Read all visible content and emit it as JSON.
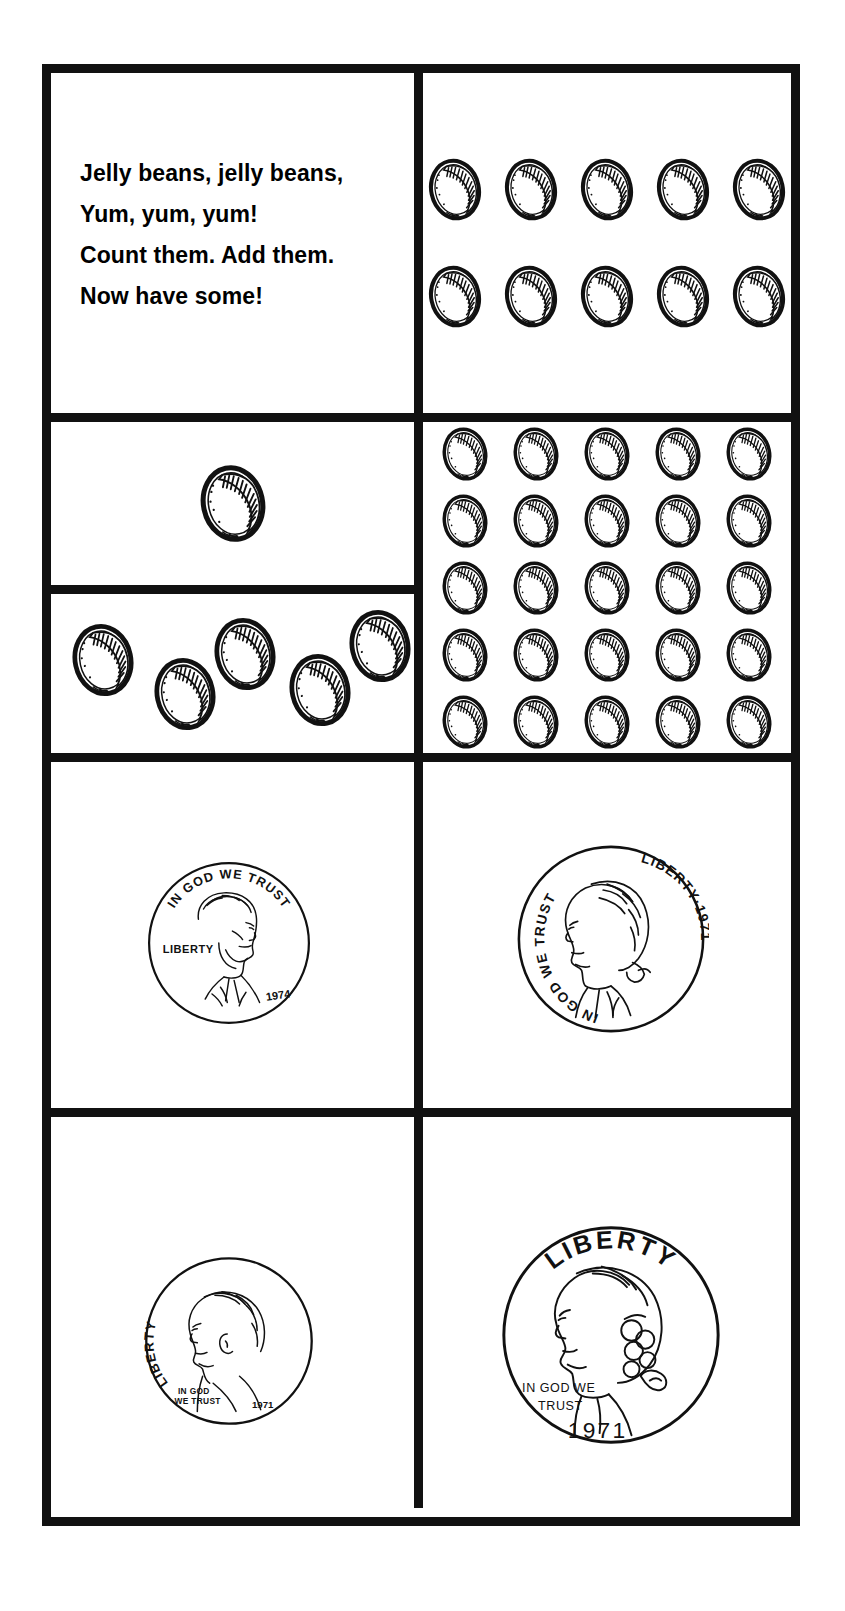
{
  "worksheet": {
    "title": "Jelly beans and coins counting worksheet",
    "ink_color": "#111111",
    "paper_color": "#ffffff"
  },
  "poem": {
    "name": "jelly-bean-rhyme",
    "lines": [
      "Jelly beans, jelly beans,",
      "Yum, yum, yum!",
      "Count them. Add them.",
      "Now have some!"
    ]
  },
  "bean_groups": [
    {
      "id": "group-ten",
      "label": "Ten jelly beans",
      "count": 10,
      "layout": "rows",
      "rows": 2,
      "columns": 5,
      "bean_size": 58
    },
    {
      "id": "group-one",
      "label": "One jelly bean",
      "count": 1,
      "layout": "single",
      "bean_size": 72
    },
    {
      "id": "group-five",
      "label": "Five jelly beans scattered",
      "count": 5,
      "layout": "scatter",
      "bean_size": 68,
      "positions": [
        {
          "left": 18,
          "top": 28
        },
        {
          "left": 100,
          "top": 62
        },
        {
          "left": 160,
          "top": 22
        },
        {
          "left": 235,
          "top": 58
        },
        {
          "left": 295,
          "top": 14
        }
      ]
    },
    {
      "id": "group-twentyfive",
      "label": "Twenty-five jelly beans",
      "count": 25,
      "layout": "grid",
      "rows": 5,
      "columns": 5,
      "bean_size": 50
    }
  ],
  "coins": [
    {
      "id": "penny",
      "name": "penny",
      "label": "Penny",
      "diameter": 170,
      "portrait": "lincoln",
      "facing": "right",
      "inscriptions": {
        "motto": "IN GOD WE TRUST",
        "liberty": "LIBERTY",
        "date": "1974"
      }
    },
    {
      "id": "nickel",
      "name": "nickel",
      "label": "Nickel",
      "diameter": 196,
      "portrait": "jefferson",
      "facing": "left",
      "inscriptions": {
        "motto": "IN GOD WE TRUST",
        "liberty_date": "LIBERTY·1971"
      }
    },
    {
      "id": "dime",
      "name": "dime",
      "label": "Dime",
      "diameter": 176,
      "portrait": "roosevelt",
      "facing": "left",
      "inscriptions": {
        "liberty": "LIBERTY",
        "motto_line1": "IN GOD",
        "motto_line2": "WE TRUST",
        "date": "1971"
      }
    },
    {
      "id": "quarter",
      "name": "quarter",
      "label": "Quarter",
      "diameter": 228,
      "portrait": "washington",
      "facing": "left",
      "inscriptions": {
        "liberty": "LIBERTY",
        "motto_line1": "IN GOD WE",
        "motto_line2": "TRUST",
        "date": "1971"
      }
    }
  ]
}
